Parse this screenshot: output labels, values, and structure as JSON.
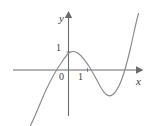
{
  "figure": {
    "kind": "cartesian-graph",
    "background_color": "#ffffff",
    "curve_color": "#8a8a8a",
    "axis_color": "#6b6b6b",
    "text_color": "#3c3c3c"
  },
  "labels": {
    "y_axis": "y",
    "x_axis": "x",
    "origin": "0",
    "y_tick_one": "1",
    "x_tick_one": "1"
  },
  "chart_data": {
    "type": "line",
    "title": "",
    "xlabel": "x",
    "ylabel": "y",
    "grid": false,
    "legend": null,
    "xlim": [
      -2.2,
      3.3
    ],
    "ylim": [
      -2.2,
      2.6
    ],
    "x_ticks": [
      0,
      1
    ],
    "x_tick_labels": [
      "0",
      "1"
    ],
    "y_ticks": [
      1
    ],
    "y_tick_labels": [
      "1"
    ],
    "annotations": [
      {
        "text": "local maximum near x = 0, y = 1"
      },
      {
        "text": "local minimum near x = 1.6, y = -1.1"
      },
      {
        "text": "x-intercepts near x = -1.1, x = 0.9, x = 2.4"
      }
    ],
    "series": [
      {
        "name": "cubic curve",
        "color": "#8a8a8a",
        "x": [
          -1.95,
          -1.8,
          -1.65,
          -1.5,
          -1.35,
          -1.2,
          -1.05,
          -0.9,
          -0.75,
          -0.6,
          -0.45,
          -0.3,
          -0.15,
          0.0,
          0.15,
          0.3,
          0.45,
          0.6,
          0.75,
          0.9,
          1.05,
          1.2,
          1.35,
          1.5,
          1.65,
          1.8,
          1.95,
          2.1,
          2.25,
          2.4,
          2.55,
          2.7,
          2.85,
          3.0
        ],
        "y": [
          -4.85,
          -4.0,
          -3.22,
          -2.52,
          -1.9,
          -1.36,
          -0.89,
          -0.5,
          -0.17,
          0.1,
          0.33,
          0.52,
          0.67,
          0.78,
          0.85,
          0.88,
          0.86,
          0.78,
          0.63,
          0.4,
          0.1,
          -0.25,
          -0.62,
          -0.95,
          -1.15,
          -1.16,
          -0.92,
          -0.4,
          0.42,
          1.56,
          3.02,
          4.8,
          6.9,
          9.3
        ]
      }
    ]
  },
  "geometry": {
    "origin_px": {
      "x": 68.5,
      "y": 70.0
    },
    "unit_px": {
      "x": 19.0,
      "y": 18.0
    },
    "x_axis_start_px": 13,
    "x_axis_end_px": 141,
    "y_axis_top_px": 14,
    "y_axis_bottom_px": 116,
    "curve_path": "M 30.5,125.5 C 35.5,116.0 40.5,102.0 46.0,90.0 C 51.0,79.5 56.0,70.0 61.5,62.5 C 64.5,58.0 67.0,54.3 69.5,52.6 C 72.5,50.8 75.5,51.2 78.5,53.5 C 82.0,56.2 85.5,61.0 89.0,66.3 C 92.5,71.8 95.5,77.6 98.5,83.2 C 101.0,88.0 103.5,92.0 106.0,94.3 C 108.5,96.4 111.0,96.3 113.5,94.0 C 116.5,91.2 119.0,86.5 121.5,80.0 C 124.5,72.0 127.5,61.0 130.5,48.0 C 133.5,35.0 136.0,22.0 138.5,13.5"
  }
}
